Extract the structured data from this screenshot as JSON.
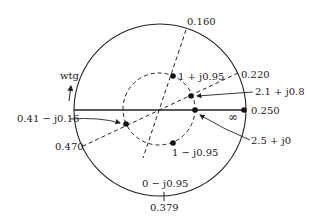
{
  "diagram": {
    "type": "smith-chart",
    "direction_label": "wtg",
    "outer_circle": {
      "cx": 160,
      "cy": 110,
      "r": 86
    },
    "swr_circle": {
      "cx": 159,
      "cy": 109,
      "r": 36
    },
    "wavelength_labels": {
      "top": "0.160",
      "upper_right": "0.220",
      "right": "0.250",
      "lower_left": "0.470",
      "bottom": "0.379"
    },
    "points": {
      "p1": {
        "label": "1 + j0.95",
        "x": 173,
        "y": 76
      },
      "p2": {
        "label": "2.1 + j0.8",
        "x": 191,
        "y": 96
      },
      "p3": {
        "label": "2.5 + j0",
        "x": 195,
        "y": 110
      },
      "p4": {
        "label": "0.41 − j0.16",
        "x": 126,
        "y": 124
      },
      "p5": {
        "label": "1 − j0.95",
        "x": 173,
        "y": 143
      },
      "p6": {
        "label": "0 − j0.95"
      }
    },
    "infinity_symbol": "∞"
  }
}
